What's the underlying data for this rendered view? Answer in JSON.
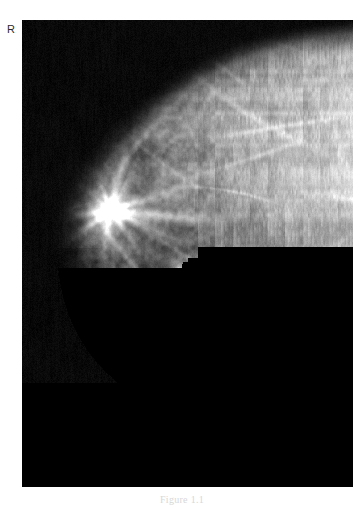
{
  "figure": {
    "modality": "mammogram",
    "caption": "Figure 1.1",
    "laterality_marker": "R",
    "frame": {
      "x": 22,
      "y": 20,
      "width": 331,
      "height": 467
    },
    "background_color": "#ffffff",
    "film_background_color": "#050505"
  },
  "image_content": {
    "view_description": "Right breast mammogram, craniocaudal projection, dense fibroglandular tissue",
    "breast_contour": {
      "skin_line_color": "#8d8d8d",
      "chest_wall_side": "right",
      "nipple_side": "left"
    },
    "tissue": {
      "parenchyma_base_color": "#6e6e6e",
      "dense_region_color": "#b9b9b9",
      "fat_region_color": "#3a3a3a",
      "background_color": "#070707"
    },
    "findings": [
      {
        "name": "spiculated-mass",
        "label": "Spiculated mass with radiating spicules",
        "x": 110,
        "y": 210,
        "radius": 17,
        "brightness": "#f2f2f2"
      },
      {
        "name": "punctate-calcification-upper",
        "label": "Punctate calcification",
        "x": 178,
        "y": 270,
        "radius": 3,
        "brightness": "#ffffff"
      },
      {
        "name": "punctate-calcification-lower",
        "label": "Punctate calcification",
        "x": 110,
        "y": 355,
        "radius": 3,
        "brightness": "#fbfbfb"
      },
      {
        "name": "circumscribed-nodule",
        "label": "Circumscribed round nodule",
        "x": 178,
        "y": 381,
        "radius": 11,
        "brightness": "#8e8e8e"
      },
      {
        "name": "dense-tissue-band",
        "label": "Dense fibroglandular band toward chest wall",
        "x": 300,
        "y": 150,
        "radius": 90,
        "brightness": "#c4c4c4"
      }
    ]
  }
}
